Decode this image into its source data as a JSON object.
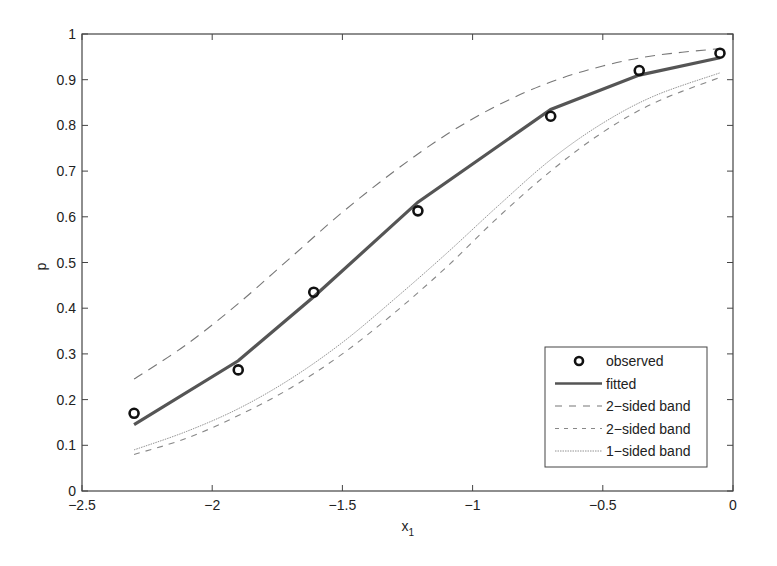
{
  "chart_data": {
    "type": "line",
    "title": "",
    "xlabel": "x",
    "xlabel_subscript": "1",
    "ylabel": "p",
    "xlim": [
      -2.5,
      0
    ],
    "ylim": [
      0,
      1
    ],
    "grid": false,
    "legend_position": "lower right",
    "x_ticks": [
      -2.5,
      -2,
      -1.5,
      -1,
      -0.5,
      0
    ],
    "x_tick_labels": [
      "−2.5",
      "−2",
      "−1.5",
      "−1",
      "−0.5",
      "0"
    ],
    "y_ticks": [
      0,
      0.1,
      0.2,
      0.3,
      0.4,
      0.5,
      0.6,
      0.7,
      0.8,
      0.9,
      1
    ],
    "y_tick_labels": [
      "0",
      "0.1",
      "0.2",
      "0.3",
      "0.4",
      "0.5",
      "0.6",
      "0.7",
      "0.8",
      "0.9",
      "1"
    ],
    "series": [
      {
        "name": "observed",
        "style": "marker-circle",
        "x": [
          -2.3,
          -1.9,
          -1.61,
          -1.21,
          -0.7,
          -0.36,
          -0.05
        ],
        "values": [
          0.17,
          0.265,
          0.435,
          0.613,
          0.82,
          0.92,
          0.958
        ]
      },
      {
        "name": "fitted",
        "style": "thick-solid",
        "x": [
          -2.3,
          -1.9,
          -1.61,
          -1.21,
          -0.7,
          -0.36,
          -0.05
        ],
        "values": [
          0.145,
          0.285,
          0.425,
          0.632,
          0.835,
          0.91,
          0.948
        ]
      },
      {
        "name": "2−sided band",
        "style": "long-dash",
        "x": [
          -2.3,
          -2.1,
          -1.9,
          -1.7,
          -1.5,
          -1.3,
          -1.1,
          -0.9,
          -0.7,
          -0.5,
          -0.3,
          -0.05
        ],
        "values": [
          0.245,
          0.32,
          0.41,
          0.51,
          0.61,
          0.7,
          0.78,
          0.845,
          0.895,
          0.93,
          0.953,
          0.968
        ]
      },
      {
        "name": "2−sided band",
        "style": "short-dash",
        "x": [
          -2.3,
          -2.1,
          -1.9,
          -1.7,
          -1.5,
          -1.3,
          -1.1,
          -0.9,
          -0.7,
          -0.5,
          -0.3,
          -0.05
        ],
        "values": [
          0.08,
          0.115,
          0.165,
          0.225,
          0.3,
          0.39,
          0.49,
          0.6,
          0.7,
          0.785,
          0.85,
          0.905
        ]
      },
      {
        "name": "1−sided band",
        "style": "thin-solid",
        "x": [
          -2.3,
          -2.1,
          -1.9,
          -1.7,
          -1.5,
          -1.3,
          -1.1,
          -0.9,
          -0.7,
          -0.5,
          -0.3,
          -0.05
        ],
        "values": [
          0.09,
          0.13,
          0.18,
          0.245,
          0.325,
          0.42,
          0.52,
          0.625,
          0.725,
          0.805,
          0.865,
          0.915
        ]
      }
    ]
  },
  "legend": {
    "items": [
      {
        "label": "observed"
      },
      {
        "label": "fitted"
      },
      {
        "label": "2−sided band"
      },
      {
        "label": "2−sided band"
      },
      {
        "label": "1−sided band"
      }
    ]
  },
  "colors": {
    "axis": "#444444",
    "observed": "#111111",
    "fitted": "#555555",
    "band_upper": "#777777",
    "band_lower": "#888888",
    "band_one_sided": "#777777"
  }
}
